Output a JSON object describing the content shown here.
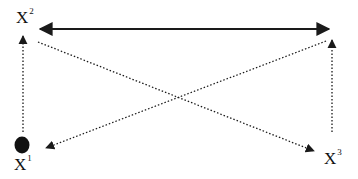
{
  "diagram": {
    "nodes": [
      {
        "id": "x1",
        "label": "X",
        "superscript": "1",
        "marker": "filled-oval"
      },
      {
        "id": "x2",
        "label": "X",
        "superscript": "2"
      },
      {
        "id": "x3",
        "label": "X",
        "superscript": "3"
      }
    ],
    "edges": [
      {
        "from": "x2",
        "to": "x3-top",
        "style": "solid",
        "arrows": "both",
        "description": "horizontal solid double-headed arrow across top"
      },
      {
        "from": "x1",
        "to": "x2",
        "style": "dotted",
        "arrows": "end",
        "description": "left vertical dotted arrow pointing up"
      },
      {
        "from": "x3",
        "to": "top-right",
        "style": "dotted",
        "arrows": "end",
        "description": "right vertical dotted arrow pointing up"
      },
      {
        "from": "x2",
        "to": "x3",
        "style": "dotted",
        "arrows": "end",
        "description": "diagonal dotted arrow top-left to bottom-right"
      },
      {
        "from": "top-right",
        "to": "x1",
        "style": "dotted",
        "arrows": "end",
        "description": "diagonal dotted arrow top-right to bottom-left"
      }
    ],
    "colors": {
      "line": "#1a1a1a",
      "background": "#ffffff"
    }
  }
}
